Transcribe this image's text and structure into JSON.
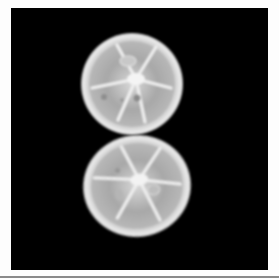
{
  "image": {
    "subject": "two citrus fruit slices on black background",
    "background_color": "#000000",
    "frame_color": "#fdfdfd",
    "rule_color": "#8a8a8a",
    "slices": [
      {
        "name": "top-slice",
        "cx": 132,
        "cy": 84,
        "rx": 51,
        "ry": 51,
        "rotate": 0,
        "segments": 6,
        "rind": "#e6e6e6",
        "flesh": "#a9a9a9",
        "core": "#f2f2f2"
      },
      {
        "name": "bottom-slice",
        "cx": 137,
        "cy": 186,
        "rx": 54,
        "ry": 51,
        "rotate": -8,
        "segments": 6,
        "rind": "#e4e4e4",
        "flesh": "#a4a4a4",
        "core": "#f0f0f0"
      }
    ]
  }
}
